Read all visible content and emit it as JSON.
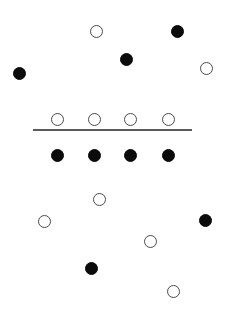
{
  "figure": {
    "width": 229,
    "height": 309,
    "background": "#ffffff",
    "filled_color": "#0b0b0b",
    "open_fill": "#ffffff",
    "open_stroke": "#4a4a4a",
    "divider_color": "#5a5a5a"
  },
  "chart_data": {
    "type": "scatter",
    "title": "",
    "subtitle": "",
    "xlabel": "",
    "ylabel": "",
    "xlim": [
      0,
      229
    ],
    "ylim": [
      0,
      309
    ],
    "grid": false,
    "legend": "none",
    "annotations": [
      {
        "name": "horizontal-divider",
        "type": "line",
        "x1": 33,
        "x2": 192,
        "y": 130,
        "thickness": 1.6,
        "color": "#5a5a5a"
      }
    ],
    "series": [
      {
        "name": "filled",
        "marker": "filled-circle",
        "color": "#0b0b0b",
        "diameter": 13,
        "points": [
          {
            "x": 177,
            "y": 31,
            "region": "above"
          },
          {
            "x": 126,
            "y": 59,
            "region": "above"
          },
          {
            "x": 19,
            "y": 73,
            "region": "above"
          },
          {
            "x": 57,
            "y": 155,
            "region": "band-below-line"
          },
          {
            "x": 94,
            "y": 155,
            "region": "band-below-line"
          },
          {
            "x": 130,
            "y": 155,
            "region": "band-below-line"
          },
          {
            "x": 168,
            "y": 155,
            "region": "band-below-line"
          },
          {
            "x": 205,
            "y": 220,
            "region": "below"
          },
          {
            "x": 91,
            "y": 268,
            "region": "below"
          }
        ]
      },
      {
        "name": "open",
        "marker": "open-circle",
        "color": "#ffffff",
        "stroke": "#4a4a4a",
        "diameter": 13,
        "points": [
          {
            "x": 96,
            "y": 31,
            "region": "above"
          },
          {
            "x": 206,
            "y": 68,
            "region": "above"
          },
          {
            "x": 57,
            "y": 119,
            "region": "band-above-line"
          },
          {
            "x": 94,
            "y": 119,
            "region": "band-above-line"
          },
          {
            "x": 130,
            "y": 119,
            "region": "band-above-line"
          },
          {
            "x": 168,
            "y": 119,
            "region": "band-above-line"
          },
          {
            "x": 99,
            "y": 199,
            "region": "below"
          },
          {
            "x": 44,
            "y": 221,
            "region": "below"
          },
          {
            "x": 150,
            "y": 241,
            "region": "below"
          },
          {
            "x": 173,
            "y": 291,
            "region": "below"
          }
        ]
      }
    ],
    "counts": {
      "filled_total": 9,
      "open_total": 10
    }
  }
}
